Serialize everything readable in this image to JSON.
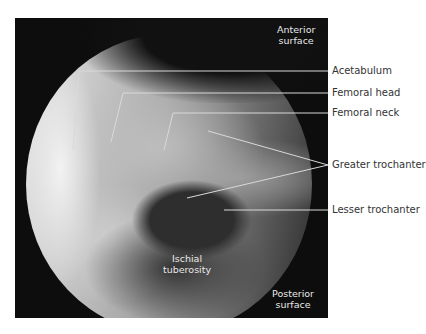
{
  "figure": {
    "type": "radiograph",
    "panel_labels": {
      "top_right": [
        "Anterior",
        "surface"
      ],
      "bottom_right": [
        "Posterior",
        "surface"
      ],
      "inner": [
        "Ischial",
        "tuberosity"
      ]
    },
    "labels": [
      {
        "text": "Acetabulum"
      },
      {
        "text": "Femoral head"
      },
      {
        "text": "Femoral neck"
      },
      {
        "text": "Greater trochanter"
      },
      {
        "text": "Lesser trochanter"
      }
    ],
    "colors": {
      "background": "#ffffff",
      "panel": "#0d0d0d",
      "leader_line": "#d9d9d9",
      "label_text": "#333333"
    }
  }
}
